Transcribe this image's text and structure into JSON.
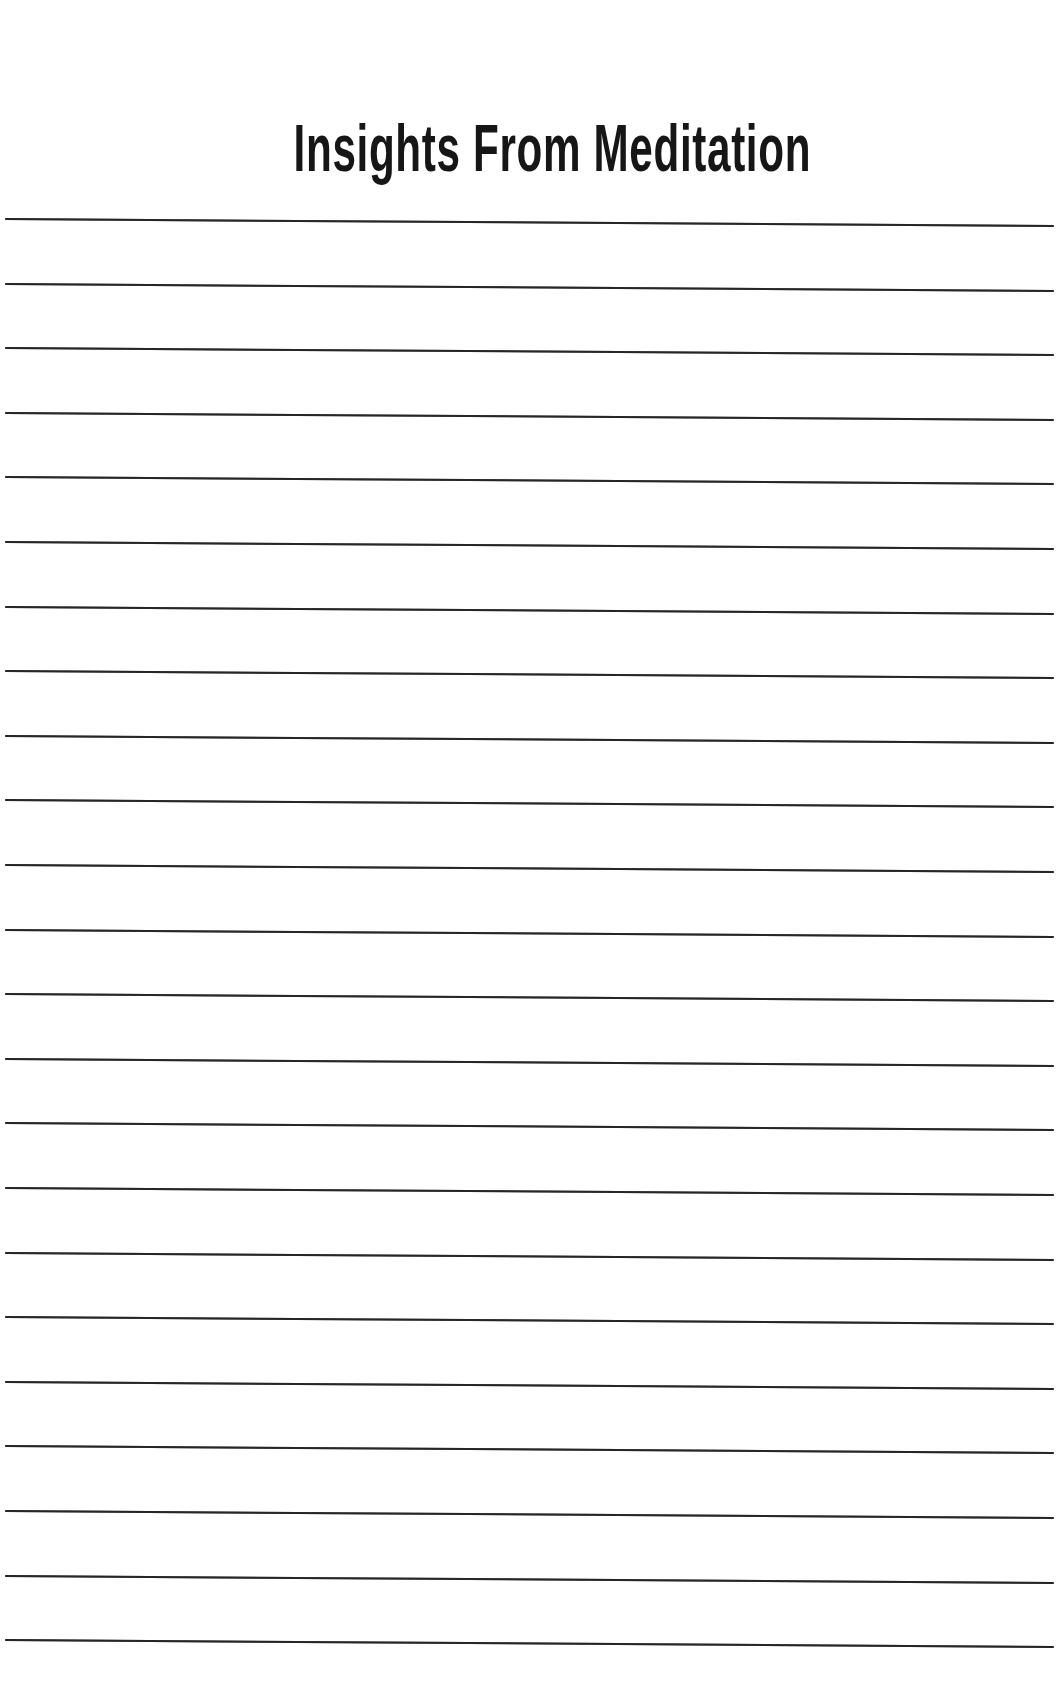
{
  "page": {
    "title": "Insights From Meditation",
    "style": {
      "line_color": "#262626",
      "title_color": "#161616",
      "background": "#ffffff"
    },
    "ruled_lines": {
      "count": 23,
      "first_line_y": 219,
      "spacing_px": 64.6
    }
  }
}
